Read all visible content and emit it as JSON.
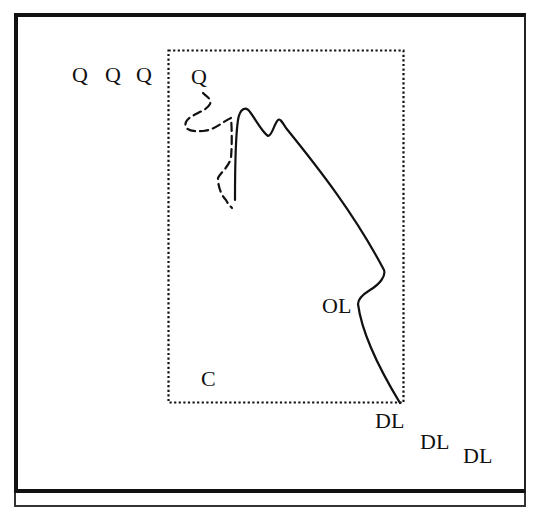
{
  "diagram": {
    "labels": {
      "q1": "Q",
      "q2": "Q",
      "q3": "Q",
      "q4": "Q",
      "ol": "OL",
      "c": "C",
      "dl1": "DL",
      "dl2": "DL",
      "dl3": "DL"
    },
    "colors": {
      "ink": "#111111",
      "background": "#ffffff"
    },
    "elements": [
      {
        "type": "outer-frame",
        "style": "solid"
      },
      {
        "type": "dotted-rectangle",
        "style": "dotted"
      },
      {
        "type": "solid-curve",
        "style": "solid"
      },
      {
        "type": "dashed-curve",
        "style": "dashed"
      }
    ]
  }
}
